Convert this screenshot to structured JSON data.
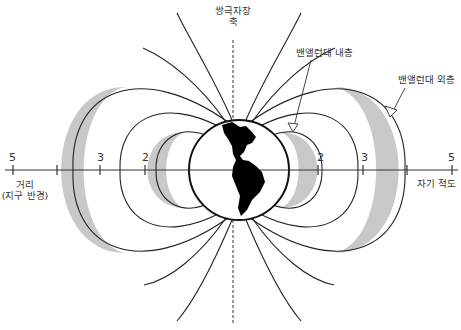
{
  "labels": {
    "axis_line1": "쌍극자장",
    "axis_line2": "축",
    "inner_belt": "밴앨런대 내층",
    "outer_belt": "밴앨런대 외층",
    "distance_line1": "거리",
    "distance_line2": "(지구 반경)",
    "magnetic_equator": "자기 적도"
  },
  "ticks": {
    "left": [
      {
        "label": "5"
      },
      {
        "label": ""
      },
      {
        "label": "3"
      },
      {
        "label": "2"
      }
    ],
    "right": [
      {
        "label": "2"
      },
      {
        "label": "3"
      },
      {
        "label": ""
      },
      {
        "label": "5"
      }
    ]
  },
  "colors": {
    "belt_fill": "#c8c8c8",
    "line": "#222222",
    "earth_land": "#000000"
  }
}
